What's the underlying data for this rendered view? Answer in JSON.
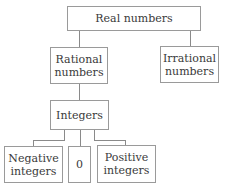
{
  "diagram": {
    "type": "tree",
    "nodes": {
      "real": "Real numbers",
      "rational": "Rational numbers",
      "rational_l1": "Rational",
      "rational_l2": "numbers",
      "irrational": "Irrational numbers",
      "irrational_l1": "Irrational",
      "irrational_l2": "numbers",
      "integers": "Integers",
      "negative_l1": "Negative",
      "negative_l2": "integers",
      "zero": "0",
      "positive_l1": "Positive",
      "positive_l2": "integers"
    },
    "edges": [
      [
        "Real numbers",
        "Rational numbers"
      ],
      [
        "Real numbers",
        "Irrational numbers"
      ],
      [
        "Rational numbers",
        "Integers"
      ],
      [
        "Integers",
        "Negative integers"
      ],
      [
        "Integers",
        "0"
      ],
      [
        "Integers",
        "Positive integers"
      ]
    ]
  }
}
